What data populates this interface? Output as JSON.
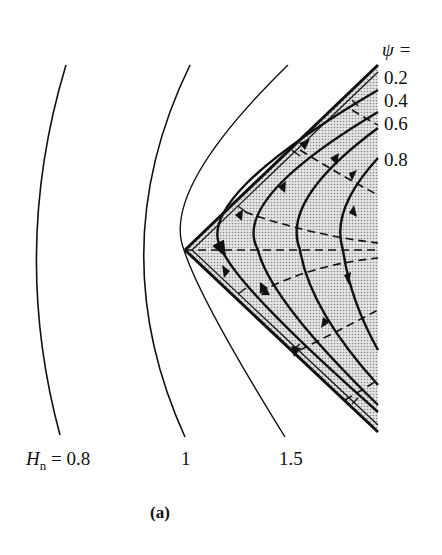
{
  "figure": {
    "caption": "(a)",
    "psi_header": "ψ =",
    "psi_labels": [
      "0.2",
      "0.4",
      "0.6",
      "0.8"
    ],
    "hn_prefix_symbol": "H",
    "hn_prefix_sub": "n",
    "hn_prefix_eq": "= 0.8",
    "hn_labels": [
      "1",
      "1.5"
    ],
    "colors": {
      "line": "#111111",
      "shade": "#cfcfcf",
      "background": "#ffffff"
    }
  }
}
